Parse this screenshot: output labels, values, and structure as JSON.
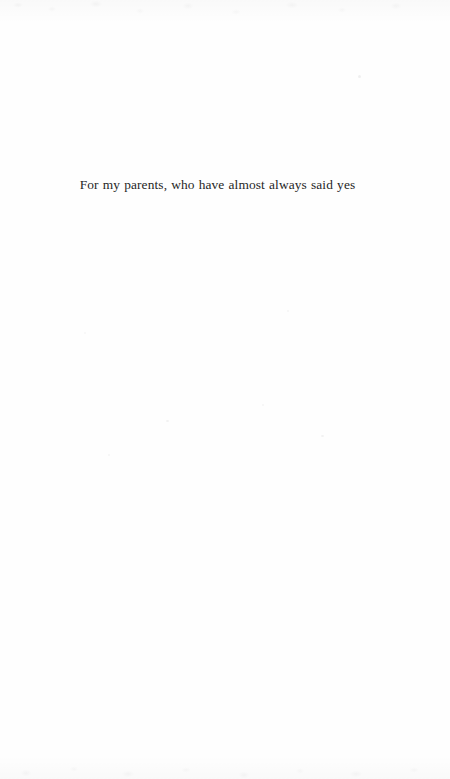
{
  "page": {
    "kind": "book-dedication-page",
    "background_color": "#fefefe",
    "ink_color": "#262626",
    "width_px": 450,
    "height_px": 779
  },
  "dedication": {
    "text": "For my parents, who have almost always said yes"
  },
  "artifacts": {
    "specks": [
      {
        "x": 358,
        "y": 75,
        "w": 3,
        "h": 3,
        "opacity": 0.06
      },
      {
        "x": 166,
        "y": 420,
        "w": 3,
        "h": 2,
        "opacity": 0.05
      },
      {
        "x": 262,
        "y": 404,
        "w": 2,
        "h": 2,
        "opacity": 0.04
      },
      {
        "x": 321,
        "y": 435,
        "w": 3,
        "h": 2,
        "opacity": 0.05
      },
      {
        "x": 108,
        "y": 454,
        "w": 2,
        "h": 2,
        "opacity": 0.04
      },
      {
        "x": 287,
        "y": 310,
        "w": 2,
        "h": 2,
        "opacity": 0.04
      },
      {
        "x": 84,
        "y": 332,
        "w": 2,
        "h": 2,
        "opacity": 0.035
      }
    ]
  }
}
